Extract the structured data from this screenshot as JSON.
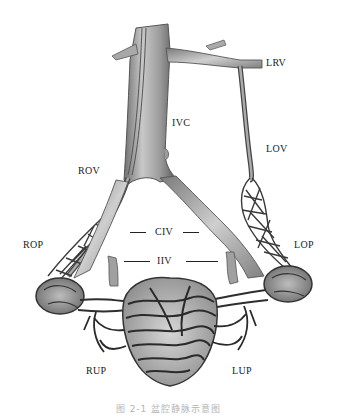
{
  "figure": {
    "type": "anatomical-diagram",
    "labels": {
      "lrv": "LRV",
      "ivc": "IVC",
      "lov": "LOV",
      "rov": "ROV",
      "civ": "CIV",
      "iiv": "IIV",
      "rop": "ROP",
      "lop": "LOP",
      "rup": "RUP",
      "lup": "LUP"
    },
    "caption": "图 2-1  盆腔静脉示意图"
  },
  "colors": {
    "background": "#ffffff",
    "vessel_light": "#bdbdbd",
    "vessel_mid": "#8a8a8a",
    "vessel_dark": "#3a3a3a",
    "label_text": "#222222"
  }
}
